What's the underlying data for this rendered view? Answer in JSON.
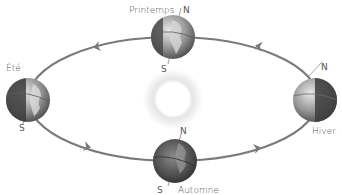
{
  "diagram": {
    "type": "earth-orbit-seasons",
    "orbit_color": "#7a7a7a",
    "sun": {
      "label": "",
      "color": "#ffffff",
      "glow_color": "#cfcfcf"
    },
    "seasons": [
      {
        "id": "printemps",
        "label": "Printemps",
        "north": "N",
        "south": "S",
        "position": "top"
      },
      {
        "id": "ete",
        "label": "Été",
        "north": "",
        "south": "S",
        "position": "left"
      },
      {
        "id": "hiver",
        "label": "Hiver",
        "north": "N",
        "south": "",
        "position": "right"
      },
      {
        "id": "automne",
        "label": "Automne",
        "north": "N",
        "south": "S",
        "position": "bottom"
      }
    ],
    "arrows": [
      {
        "position": "top-left",
        "direction": "left"
      },
      {
        "position": "top-right",
        "direction": "left"
      },
      {
        "position": "bottom-left",
        "direction": "right"
      },
      {
        "position": "bottom-right",
        "direction": "right"
      }
    ]
  }
}
